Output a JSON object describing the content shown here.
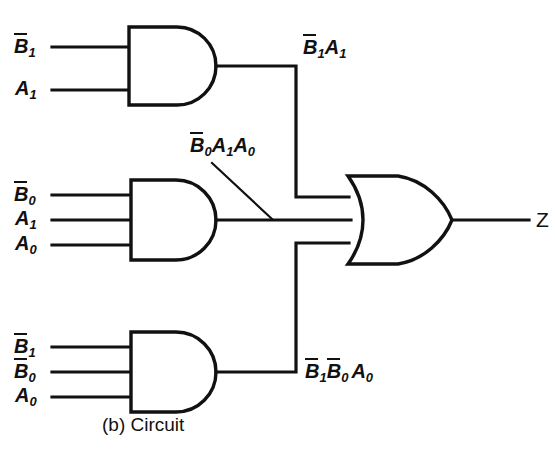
{
  "figure": {
    "caption": "(b)  Circuit",
    "output_signal": "Z"
  },
  "gates": [
    {
      "id": "and-gate-top",
      "type": "AND",
      "inputs": [
        {
          "base": "B",
          "subscript": "1",
          "overbar": true
        },
        {
          "base": "A",
          "subscript": "1",
          "overbar": false
        }
      ],
      "output_label": [
        {
          "base": "B",
          "subscript": "1",
          "overbar": true
        },
        {
          "base": "A",
          "subscript": "1",
          "overbar": false
        }
      ]
    },
    {
      "id": "and-gate-middle",
      "type": "AND",
      "inputs": [
        {
          "base": "B",
          "subscript": "0",
          "overbar": true
        },
        {
          "base": "A",
          "subscript": "1",
          "overbar": false
        },
        {
          "base": "A",
          "subscript": "0",
          "overbar": false
        }
      ],
      "output_label": [
        {
          "base": "B",
          "subscript": "0",
          "overbar": true
        },
        {
          "base": "A",
          "subscript": "1",
          "overbar": false
        },
        {
          "base": "A",
          "subscript": "0",
          "overbar": false
        }
      ]
    },
    {
      "id": "and-gate-bottom",
      "type": "AND",
      "inputs": [
        {
          "base": "B",
          "subscript": "1",
          "overbar": true
        },
        {
          "base": "B",
          "subscript": "0",
          "overbar": true
        },
        {
          "base": "A",
          "subscript": "0",
          "overbar": false
        }
      ],
      "output_label": [
        {
          "base": "B",
          "subscript": "1",
          "overbar": true
        },
        {
          "base": "B",
          "subscript": "0",
          "overbar": true
        },
        {
          "base": "A",
          "subscript": "0",
          "overbar": false
        }
      ]
    },
    {
      "id": "or-gate",
      "type": "OR",
      "inputs": [],
      "output_label": [
        {
          "base": "Z",
          "subscript": "",
          "overbar": false
        }
      ]
    }
  ],
  "colors": {
    "ink": "#111111",
    "background": "#ffffff"
  }
}
